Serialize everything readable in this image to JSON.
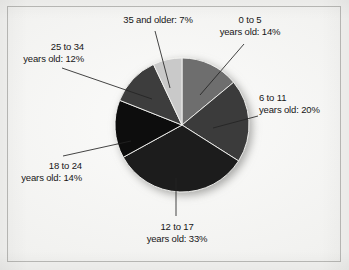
{
  "figure": {
    "background_color": "#f1f1ef",
    "frame_border_color": "#b9b9b6"
  },
  "chart_data": {
    "type": "pie",
    "title": "",
    "xlabel": "",
    "ylabel": "",
    "legend_position": "none",
    "grid": false,
    "units": "percent",
    "start_angle_deg": 0,
    "direction": "clockwise",
    "categories": [
      "0 to 5 years old",
      "6 to 11 years old",
      "12 to 17 years old",
      "18 to 24 years old",
      "25 to 34 years old",
      "35 and older"
    ],
    "values": [
      14,
      20,
      33,
      14,
      12,
      7
    ],
    "slices": [
      {
        "key": "age-0-5",
        "label_line1": "0 to 5",
        "label_line2": "years old: 14%",
        "value": 14,
        "color": "#6e6e6e",
        "start_deg": 0,
        "end_deg": 50.4
      },
      {
        "key": "age-6-11",
        "label_line1": "6 to 11",
        "label_line2": "years old: 20%",
        "value": 20,
        "color": "#3a3a3a",
        "start_deg": 50.4,
        "end_deg": 122.4
      },
      {
        "key": "age-12-17",
        "label_line1": "12 to 17",
        "label_line2": "years old: 33%",
        "value": 33,
        "color": "#1d1d1d",
        "start_deg": 122.4,
        "end_deg": 241.2
      },
      {
        "key": "age-18-24",
        "label_line1": "18 to 24",
        "label_line2": "years old: 14%",
        "value": 14,
        "color": "#0c0c0c",
        "start_deg": 241.2,
        "end_deg": 291.6
      },
      {
        "key": "age-25-34",
        "label_line1": "25 to 34",
        "label_line2": "years old: 12%",
        "value": 12,
        "color": "#3d3d3d",
        "start_deg": 291.6,
        "end_deg": 334.8
      },
      {
        "key": "age-35-older",
        "label_line1": "35 and older: 7%",
        "label_line2": "",
        "value": 7,
        "color": "#c9c9c9",
        "start_deg": 334.8,
        "end_deg": 360
      }
    ]
  }
}
